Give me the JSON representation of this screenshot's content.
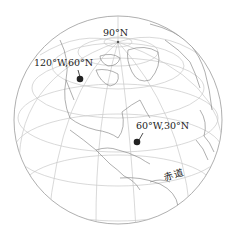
{
  "map": {
    "projection": "orthographic globe",
    "labels": {
      "north_pole": "90°N",
      "point_a": "120°W,60°N",
      "point_b": "60°W,30°N",
      "equator": "赤道"
    },
    "colors": {
      "graticule": "#c8c8c8",
      "coastline": "#7a7a7a",
      "point": "#222222",
      "text": "#222222"
    }
  }
}
